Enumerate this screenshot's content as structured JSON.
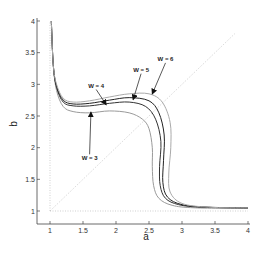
{
  "chart_data": {
    "type": "line",
    "title": "",
    "xlabel": "a",
    "ylabel": "b",
    "xlim": [
      1,
      4
    ],
    "ylim": [
      1,
      4
    ],
    "grid": false,
    "legend": "none (inline annotations with arrows)",
    "xticks": [
      "1",
      "1.5",
      "2",
      "2.5",
      "3",
      "3.5",
      "4"
    ],
    "yticks": [
      "1",
      "1.5",
      "2",
      "2.5",
      "3",
      "3.5",
      "4"
    ],
    "reference_lines": [
      {
        "name": "diagonal a=b",
        "style": "dotted",
        "points": [
          [
            1,
            1
          ],
          [
            3.8,
            3.8
          ]
        ]
      },
      {
        "name": "a=1",
        "style": "dotted",
        "points": [
          [
            1,
            1
          ],
          [
            1,
            4
          ]
        ]
      },
      {
        "name": "b=1",
        "style": "dotted",
        "points": [
          [
            1,
            1
          ],
          [
            4,
            1
          ]
        ]
      }
    ],
    "series": [
      {
        "name": "W = 3",
        "color": "#9a9a9a",
        "points": [
          [
            1.02,
            4
          ],
          [
            1.05,
            3.3
          ],
          [
            1.1,
            2.9
          ],
          [
            1.2,
            2.65
          ],
          [
            1.35,
            2.57
          ],
          [
            1.6,
            2.55
          ],
          [
            1.9,
            2.58
          ],
          [
            2.2,
            2.55
          ],
          [
            2.4,
            2.45
          ],
          [
            2.5,
            2.3
          ],
          [
            2.55,
            2.0
          ],
          [
            2.55,
            1.7
          ],
          [
            2.57,
            1.4
          ],
          [
            2.65,
            1.2
          ],
          [
            2.85,
            1.09
          ],
          [
            3.2,
            1.05
          ],
          [
            4,
            1.04
          ]
        ]
      },
      {
        "name": "W = 4",
        "color": "#333333",
        "points": [
          [
            1.02,
            4
          ],
          [
            1.05,
            3.3
          ],
          [
            1.1,
            2.95
          ],
          [
            1.2,
            2.72
          ],
          [
            1.35,
            2.66
          ],
          [
            1.6,
            2.66
          ],
          [
            1.9,
            2.7
          ],
          [
            2.2,
            2.72
          ],
          [
            2.45,
            2.65
          ],
          [
            2.6,
            2.45
          ],
          [
            2.68,
            2.1
          ],
          [
            2.66,
            1.7
          ],
          [
            2.67,
            1.4
          ],
          [
            2.75,
            1.2
          ],
          [
            2.95,
            1.1
          ],
          [
            3.3,
            1.06
          ],
          [
            4,
            1.05
          ]
        ]
      },
      {
        "name": "W = 5",
        "color": "#222222",
        "points": [
          [
            1.02,
            4
          ],
          [
            1.05,
            3.3
          ],
          [
            1.1,
            2.97
          ],
          [
            1.2,
            2.75
          ],
          [
            1.35,
            2.69
          ],
          [
            1.6,
            2.7
          ],
          [
            1.9,
            2.75
          ],
          [
            2.2,
            2.79
          ],
          [
            2.5,
            2.74
          ],
          [
            2.65,
            2.55
          ],
          [
            2.73,
            2.2
          ],
          [
            2.72,
            1.8
          ],
          [
            2.71,
            1.45
          ],
          [
            2.78,
            1.22
          ],
          [
            3.0,
            1.1
          ],
          [
            3.4,
            1.06
          ],
          [
            4,
            1.05
          ]
        ]
      },
      {
        "name": "W = 6",
        "color": "#aaaaaa",
        "points": [
          [
            1.02,
            4
          ],
          [
            1.05,
            3.3
          ],
          [
            1.1,
            3.0
          ],
          [
            1.2,
            2.78
          ],
          [
            1.35,
            2.72
          ],
          [
            1.6,
            2.74
          ],
          [
            1.9,
            2.8
          ],
          [
            2.2,
            2.85
          ],
          [
            2.5,
            2.85
          ],
          [
            2.7,
            2.72
          ],
          [
            2.82,
            2.4
          ],
          [
            2.83,
            2.0
          ],
          [
            2.8,
            1.6
          ],
          [
            2.82,
            1.3
          ],
          [
            3.0,
            1.12
          ],
          [
            3.4,
            1.06
          ],
          [
            4,
            1.05
          ]
        ]
      }
    ],
    "annotations": [
      {
        "text": "W = 3",
        "text_xy": [
          1.6,
          1.8
        ],
        "arrow_to": [
          1.62,
          2.56
        ]
      },
      {
        "text": "W = 4",
        "text_xy": [
          1.7,
          2.95
        ],
        "arrow_to": [
          1.85,
          2.68
        ]
      },
      {
        "text": "W = 5",
        "text_xy": [
          2.38,
          3.2
        ],
        "arrow_to": [
          2.26,
          2.76
        ]
      },
      {
        "text": "W = 6",
        "text_xy": [
          2.75,
          3.37
        ],
        "arrow_to": [
          2.55,
          2.85
        ]
      }
    ]
  },
  "labels": {
    "xlabel": "a",
    "ylabel": "b",
    "xticks": [
      "1",
      "1.5",
      "2",
      "2.5",
      "3",
      "3.5",
      "4"
    ],
    "yticks": [
      "1",
      "1.5",
      "2",
      "2.5",
      "3",
      "3.5",
      "4"
    ],
    "annot_w3": "W = 3",
    "annot_w4": "W = 4",
    "annot_w5": "W = 5",
    "annot_w6": "W = 6"
  }
}
